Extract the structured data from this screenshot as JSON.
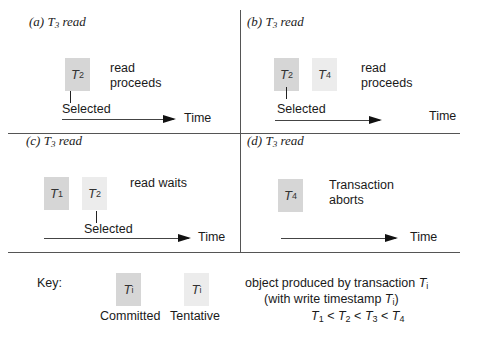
{
  "panels": {
    "a": {
      "prefix": "(a) ",
      "tvar": "T",
      "tsub": "3",
      "suffix": " read",
      "boxes": [
        {
          "name": "T",
          "sub": "2",
          "state": "committed"
        }
      ],
      "selected_label": "Selected",
      "outcome": [
        "read",
        "proceeds"
      ],
      "time_label": "Time"
    },
    "b": {
      "prefix": "(b) ",
      "tvar": "T",
      "tsub": "3",
      "suffix": " read",
      "boxes": [
        {
          "name": "T",
          "sub": "2",
          "state": "committed"
        },
        {
          "name": "T",
          "sub": "4",
          "state": "tentative"
        }
      ],
      "selected_label": "Selected",
      "outcome": [
        "read",
        "proceeds"
      ],
      "time_label": "Time"
    },
    "c": {
      "prefix": "(c) ",
      "tvar": "T",
      "tsub": "3",
      "suffix": " read",
      "boxes": [
        {
          "name": "T",
          "sub": "1",
          "state": "committed"
        },
        {
          "name": "T",
          "sub": "2",
          "state": "tentative"
        }
      ],
      "selected_label": "Selected",
      "outcome": [
        "read waits"
      ],
      "time_label": "Time"
    },
    "d": {
      "prefix": "(d) ",
      "tvar": "T",
      "tsub": "3",
      "suffix": " read",
      "boxes": [
        {
          "name": "T",
          "sub": "4",
          "state": "committed"
        }
      ],
      "outcome": [
        "Transaction",
        "aborts"
      ],
      "time_label": "Time"
    }
  },
  "key": {
    "title": "Key:",
    "committed": {
      "name": "T",
      "sub": "i",
      "label": "Committed"
    },
    "tentative": {
      "name": "T",
      "sub": "i",
      "label": "Tentative"
    },
    "description_line1": "object produced by transaction ",
    "description_line2_pre": "(with write timestamp ",
    "description_line2_post": ")",
    "tvar": "T",
    "isub": "i",
    "ordering": [
      {
        "name": "T",
        "sub": "1"
      },
      {
        "op": "<"
      },
      {
        "name": "T",
        "sub": "2"
      },
      {
        "op": "<"
      },
      {
        "name": "T",
        "sub": "3"
      },
      {
        "op": "<"
      },
      {
        "name": "T",
        "sub": "4"
      }
    ]
  },
  "colors": {
    "committed": "#d6d6d6",
    "tentative": "#ececec",
    "lines": "#555555"
  }
}
